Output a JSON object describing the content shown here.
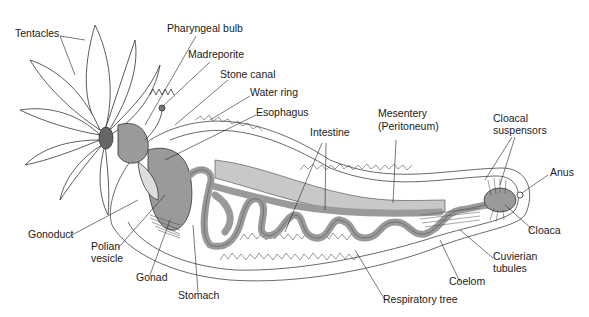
{
  "diagram": {
    "type": "anatomical illustration",
    "colors": {
      "organ_fill": "#9a9a9a",
      "mesentery_fill": "#c8c8c8",
      "outline": "#333333",
      "background": "#ffffff"
    },
    "labels": {
      "tentacles": "Tentacles",
      "pharyngeal_bulb": "Pharyngeal bulb",
      "madreporite": "Madreporite",
      "stone_canal": "Stone canal",
      "water_ring": "Water ring",
      "esophagus": "Esophagus",
      "intestine": "Intestine",
      "mesentery_1": "Mesentery",
      "mesentery_2": "(Peritoneum)",
      "cloacal_suspensors_1": "Cloacal",
      "cloacal_suspensors_2": "suspensors",
      "anus": "Anus",
      "cloaca": "Cloaca",
      "cuvierian_tubules_1": "Cuvierian",
      "cuvierian_tubules_2": "tubules",
      "coelom": "Coelom",
      "respiratory_tree": "Respiratory tree",
      "stomach": "Stomach",
      "gonad": "Gonad",
      "polian_vesicle_1": "Polian",
      "polian_vesicle_2": "vesicle",
      "gonoduct": "Gonoduct"
    }
  }
}
